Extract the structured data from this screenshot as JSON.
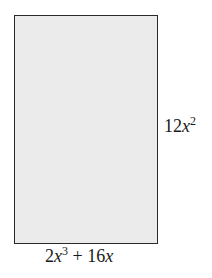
{
  "diagram": {
    "shape": "rectangle",
    "fill_color": "#ebebeb",
    "stroke_color": "#2a2a2a",
    "height_label": {
      "coef": "12",
      "var": "x",
      "exp": "2",
      "text": "12x^2"
    },
    "width_label": {
      "coef1": "2",
      "var1": "x",
      "exp1": "3",
      "op": " + ",
      "coef2": "16",
      "var2": "x",
      "text": "2x^3 + 16x"
    }
  }
}
